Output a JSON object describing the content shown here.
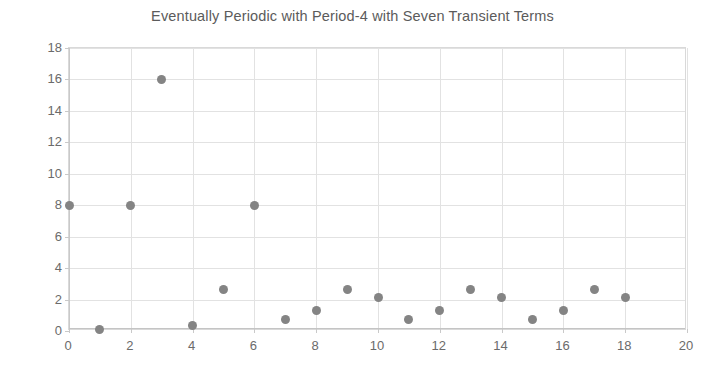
{
  "chart_data": {
    "type": "scatter",
    "title": "Eventually Periodic with Period-4 with Seven Transient Terms",
    "xlabel": "",
    "ylabel": "",
    "xlim": [
      0,
      20
    ],
    "ylim": [
      0,
      18
    ],
    "xticks": [
      0,
      2,
      4,
      6,
      8,
      10,
      12,
      14,
      16,
      18,
      20
    ],
    "yticks": [
      0,
      2,
      4,
      6,
      8,
      10,
      12,
      14,
      16,
      18
    ],
    "grid": true,
    "legend": false,
    "marker_color": "#848484",
    "marker_size": 9,
    "gridline_color": "#e2e2e2",
    "axis_color": "#c9c9c9",
    "title_color": "#5b5b5b",
    "tick_label_color": "#6b6b6b",
    "transient_terms": 7,
    "period": 4,
    "x": [
      0,
      1,
      2,
      3,
      4,
      5,
      6,
      7,
      8,
      9,
      10,
      11,
      12,
      13,
      14,
      15,
      16,
      17,
      18
    ],
    "y": [
      8,
      0.1,
      8,
      16,
      0.35,
      2.65,
      8,
      0.7,
      1.3,
      2.65,
      2.15,
      0.7,
      1.3,
      2.65,
      2.15,
      0.7,
      1.3,
      2.65,
      2.15
    ],
    "points": [
      {
        "x": 0,
        "y": 8
      },
      {
        "x": 1,
        "y": 0.1
      },
      {
        "x": 2,
        "y": 8
      },
      {
        "x": 3,
        "y": 16
      },
      {
        "x": 4,
        "y": 0.35
      },
      {
        "x": 5,
        "y": 2.65
      },
      {
        "x": 6,
        "y": 8
      },
      {
        "x": 7,
        "y": 0.7
      },
      {
        "x": 8,
        "y": 1.3
      },
      {
        "x": 9,
        "y": 2.65
      },
      {
        "x": 10,
        "y": 2.15
      },
      {
        "x": 11,
        "y": 0.7
      },
      {
        "x": 12,
        "y": 1.3
      },
      {
        "x": 13,
        "y": 2.65
      },
      {
        "x": 14,
        "y": 2.15
      },
      {
        "x": 15,
        "y": 0.7
      },
      {
        "x": 16,
        "y": 1.3
      },
      {
        "x": 17,
        "y": 2.65
      },
      {
        "x": 18,
        "y": 2.15
      }
    ]
  }
}
